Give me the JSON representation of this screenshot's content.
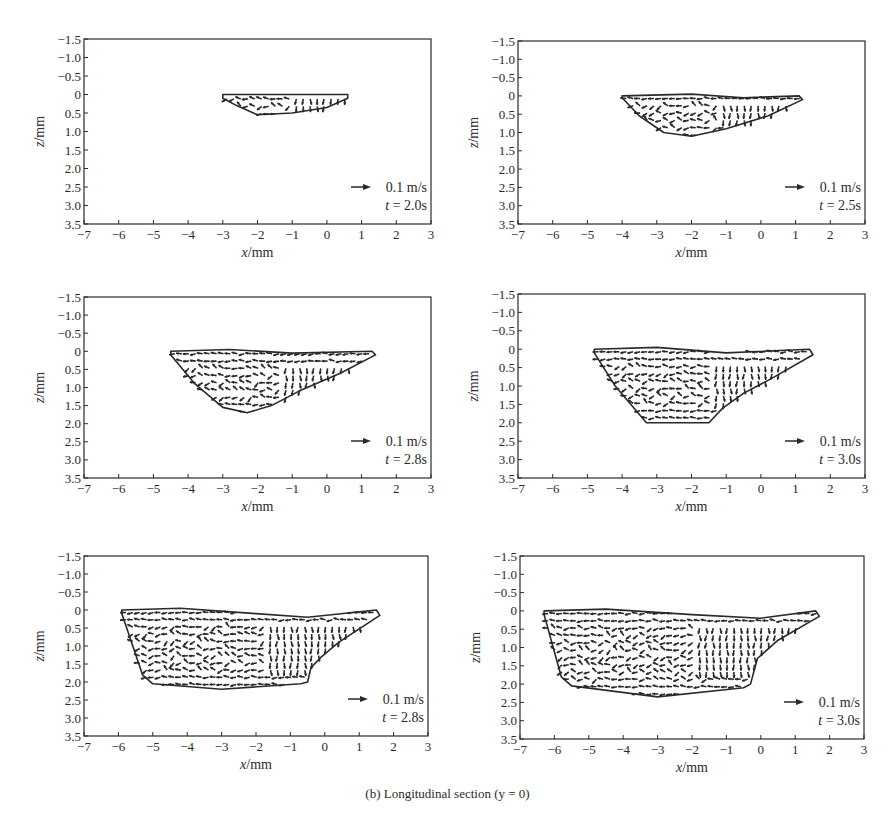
{
  "figure": {
    "caption": "(b) Longitudinal section (y = 0)",
    "ink_color": "#2a2a2a",
    "background": "#ffffff"
  },
  "chart_data": [
    {
      "type": "scatter",
      "subtype": "vector-field",
      "title": "",
      "xlabel": "x/mm",
      "ylabel": "z/mm",
      "xlim": [
        -7,
        3
      ],
      "ylim": [
        3.5,
        -1.5
      ],
      "xticks": [
        "-7",
        "-6",
        "-5",
        "-4",
        "-3",
        "-2",
        "-1",
        "0",
        "1",
        "2",
        "3"
      ],
      "yticks": [
        "-1.5",
        "-1.0",
        "-0.5",
        "0",
        "0.5",
        "1.0",
        "1.5",
        "2.0",
        "2.5",
        "3.0",
        "3.5"
      ],
      "grid": false,
      "legend": {
        "position": "lower-right",
        "arrow_scale": "0.1 m/s",
        "time": "t = 2.0s"
      },
      "boundary": [
        [
          -3.0,
          0.0
        ],
        [
          0.6,
          0.0
        ],
        [
          0.6,
          0.1
        ],
        [
          0.0,
          0.35
        ],
        [
          -1.0,
          0.5
        ],
        [
          -2.0,
          0.55
        ],
        [
          -2.6,
          0.3
        ],
        [
          -3.0,
          0.1
        ]
      ]
    },
    {
      "type": "scatter",
      "subtype": "vector-field",
      "title": "",
      "xlabel": "x/mm",
      "ylabel": "z/mm",
      "xlim": [
        -7,
        3
      ],
      "ylim": [
        3.5,
        -1.5
      ],
      "xticks": [
        "-7",
        "-6",
        "-5",
        "-4",
        "-3",
        "-2",
        "-1",
        "0",
        "1",
        "2",
        "3"
      ],
      "yticks": [
        "-1.5",
        "-1.0",
        "-0.5",
        "0",
        "0.5",
        "1.0",
        "1.5",
        "2.0",
        "2.5",
        "3.0",
        "3.5"
      ],
      "grid": false,
      "legend": {
        "position": "lower-right",
        "arrow_scale": "0.1 m/s",
        "time": "t = 2.5s"
      },
      "boundary": [
        [
          -4.0,
          0.0
        ],
        [
          -2.0,
          -0.05
        ],
        [
          -0.5,
          0.05
        ],
        [
          1.1,
          0.0
        ],
        [
          1.2,
          0.1
        ],
        [
          0.2,
          0.55
        ],
        [
          -1.0,
          0.9
        ],
        [
          -2.0,
          1.1
        ],
        [
          -2.8,
          1.0
        ],
        [
          -3.5,
          0.55
        ],
        [
          -4.0,
          0.05
        ]
      ]
    },
    {
      "type": "scatter",
      "subtype": "vector-field",
      "title": "",
      "xlabel": "x/mm",
      "ylabel": "z/mm",
      "xlim": [
        -7,
        3
      ],
      "ylim": [
        3.5,
        -1.5
      ],
      "xticks": [
        "-7",
        "-6",
        "-5",
        "-4",
        "-3",
        "-2",
        "-1",
        "0",
        "1",
        "2",
        "3"
      ],
      "yticks": [
        "-1.5",
        "-1.0",
        "-0.5",
        "0",
        "0.5",
        "1.0",
        "1.5",
        "2.0",
        "2.5",
        "3.0",
        "3.5"
      ],
      "grid": false,
      "legend": {
        "position": "lower-right",
        "arrow_scale": "0.1 m/s",
        "time": "t = 2.8s"
      },
      "boundary": [
        [
          -4.5,
          0.0
        ],
        [
          -2.8,
          -0.05
        ],
        [
          -1.0,
          0.05
        ],
        [
          1.3,
          0.0
        ],
        [
          1.4,
          0.1
        ],
        [
          0.4,
          0.6
        ],
        [
          -0.8,
          1.1
        ],
        [
          -1.6,
          1.5
        ],
        [
          -2.3,
          1.7
        ],
        [
          -3.0,
          1.55
        ],
        [
          -3.8,
          0.9
        ],
        [
          -4.5,
          0.1
        ]
      ]
    },
    {
      "type": "scatter",
      "subtype": "vector-field",
      "title": "",
      "xlabel": "x/mm",
      "ylabel": "z/mm",
      "xlim": [
        -7,
        3
      ],
      "ylim": [
        3.5,
        -1.5
      ],
      "xticks": [
        "-7",
        "-6",
        "-5",
        "-4",
        "-3",
        "-2",
        "-1",
        "0",
        "1",
        "2",
        "3"
      ],
      "yticks": [
        "-1.5",
        "-1.0",
        "-0.5",
        "0",
        "0.5",
        "1.0",
        "1.5",
        "2.0",
        "2.5",
        "3.0",
        "3.5"
      ],
      "grid": false,
      "legend": {
        "position": "lower-right",
        "arrow_scale": "0.1 m/s",
        "time": "t = 3.0s"
      },
      "boundary": [
        [
          -4.8,
          0.0
        ],
        [
          -3.0,
          -0.05
        ],
        [
          -1.0,
          0.1
        ],
        [
          1.4,
          0.0
        ],
        [
          1.5,
          0.15
        ],
        [
          0.3,
          0.8
        ],
        [
          -0.5,
          1.2
        ],
        [
          -1.1,
          1.6
        ],
        [
          -1.5,
          2.0
        ],
        [
          -3.3,
          2.0
        ],
        [
          -4.2,
          1.0
        ],
        [
          -4.8,
          0.1
        ]
      ]
    },
    {
      "type": "scatter",
      "subtype": "vector-field",
      "title": "",
      "xlabel": "x/mm",
      "ylabel": "z/mm",
      "xlim": [
        -7,
        3
      ],
      "ylim": [
        3.5,
        -1.5
      ],
      "xticks": [
        "-7",
        "-6",
        "-5",
        "-4",
        "-3",
        "-2",
        "-1",
        "0",
        "1",
        "2",
        "3"
      ],
      "yticks": [
        "-1.5",
        "-1.0",
        "-0.5",
        "0",
        "0.5",
        "1.0",
        "1.5",
        "2.0",
        "2.5",
        "3.0",
        "3.5"
      ],
      "grid": false,
      "legend": {
        "position": "lower-right",
        "arrow_scale": "0.1 m/s",
        "time": "t = 2.8s"
      },
      "boundary": [
        [
          -5.9,
          0.0
        ],
        [
          -4.2,
          -0.05
        ],
        [
          -2.0,
          0.1
        ],
        [
          -0.5,
          0.2
        ],
        [
          1.5,
          0.0
        ],
        [
          1.6,
          0.15
        ],
        [
          0.4,
          0.9
        ],
        [
          -0.1,
          1.3
        ],
        [
          -0.4,
          1.6
        ],
        [
          -0.5,
          2.0
        ],
        [
          -0.7,
          2.05
        ],
        [
          -3.0,
          2.2
        ],
        [
          -5.0,
          2.05
        ],
        [
          -5.3,
          1.8
        ],
        [
          -5.9,
          0.1
        ]
      ]
    },
    {
      "type": "scatter",
      "subtype": "vector-field",
      "title": "",
      "xlabel": "x/mm",
      "ylabel": "z/mm",
      "xlim": [
        -7,
        3
      ],
      "ylim": [
        3.5,
        -1.5
      ],
      "xticks": [
        "-7",
        "-6",
        "-5",
        "-4",
        "-3",
        "-2",
        "-1",
        "0",
        "1",
        "2",
        "3"
      ],
      "yticks": [
        "-1.5",
        "-1.0",
        "-0.5",
        "0",
        "0.5",
        "1.0",
        "1.5",
        "2.0",
        "2.5",
        "3.0",
        "3.5"
      ],
      "grid": false,
      "legend": {
        "position": "lower-right",
        "arrow_scale": "0.1 m/s",
        "time": "t = 3.0s"
      },
      "boundary": [
        [
          -6.3,
          0.0
        ],
        [
          -4.5,
          -0.05
        ],
        [
          -2.0,
          0.1
        ],
        [
          0.0,
          0.2
        ],
        [
          1.6,
          0.0
        ],
        [
          1.7,
          0.15
        ],
        [
          0.5,
          0.8
        ],
        [
          -0.1,
          1.3
        ],
        [
          -0.3,
          2.0
        ],
        [
          -0.5,
          2.1
        ],
        [
          -3.0,
          2.35
        ],
        [
          -5.5,
          2.05
        ],
        [
          -5.8,
          1.8
        ],
        [
          -6.3,
          0.1
        ]
      ]
    }
  ],
  "panels_layout": [
    {
      "left": 84,
      "top": 39,
      "right": 431,
      "bottom": 224
    },
    {
      "left": 518,
      "top": 41,
      "right": 865,
      "bottom": 224
    },
    {
      "left": 84,
      "top": 297,
      "right": 431,
      "bottom": 478
    },
    {
      "left": 518,
      "top": 294,
      "right": 865,
      "bottom": 478
    },
    {
      "left": 84,
      "top": 556,
      "right": 428,
      "bottom": 736
    },
    {
      "left": 520,
      "top": 556,
      "right": 864,
      "bottom": 739
    }
  ]
}
